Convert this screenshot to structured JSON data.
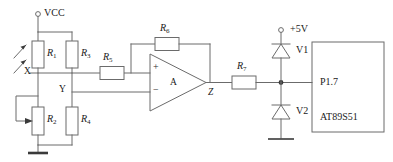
{
  "diagram": {
    "type": "schematic",
    "colors": {
      "wire": "#6b6b6b",
      "text": "#1a1a1a",
      "junction": "#3a3a3a",
      "background": "#ffffff"
    }
  },
  "supplies": [
    {
      "id": "vcc",
      "label": "VCC",
      "terminal": "open-circle"
    },
    {
      "id": "v5",
      "label": "+5V",
      "terminal": "open-circle"
    }
  ],
  "nodes": [
    {
      "id": "x",
      "label": "X"
    },
    {
      "id": "y",
      "label": "Y"
    },
    {
      "id": "z",
      "label": "Z"
    }
  ],
  "resistors": [
    {
      "id": "r1",
      "name": "R",
      "sub": "1",
      "kind": "photoresistor"
    },
    {
      "id": "r2",
      "name": "R",
      "sub": "2",
      "kind": "potentiometer"
    },
    {
      "id": "r3",
      "name": "R",
      "sub": "3",
      "kind": "fixed"
    },
    {
      "id": "r4",
      "name": "R",
      "sub": "4",
      "kind": "fixed"
    },
    {
      "id": "r5",
      "name": "R",
      "sub": "5",
      "kind": "fixed"
    },
    {
      "id": "r6",
      "name": "R",
      "sub": "6",
      "kind": "fixed"
    },
    {
      "id": "r7",
      "name": "R",
      "sub": "7",
      "kind": "fixed"
    }
  ],
  "opamp": {
    "id": "a",
    "label": "A",
    "plus_label": "+",
    "minus_label": "−",
    "output_node": "Z"
  },
  "diodes": [
    {
      "id": "v1",
      "label": "V1",
      "orientation": "up"
    },
    {
      "id": "v2",
      "label": "V2",
      "orientation": "up"
    }
  ],
  "chip": {
    "id": "u1",
    "pin_label": "P1.7",
    "part_label": "AT89S51"
  },
  "icons": {
    "light_arrows": "incident-light-arrows",
    "ground": "ground-symbol",
    "wiper": "potentiometer-wiper-arrow"
  }
}
